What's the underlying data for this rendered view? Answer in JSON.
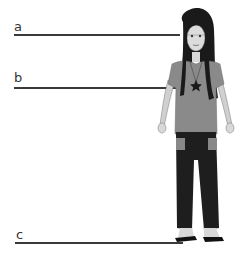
{
  "diagram": {
    "type": "labeled height reference lines with figure",
    "figure": "cartoon girl with long black hair, gray t-shirt, star necklace, black pants, flip-flops",
    "lines": [
      {
        "label": "a",
        "y": 34,
        "x1": 14,
        "x2": 180,
        "label_x": 14,
        "label_y": 20,
        "description": "head / eye level"
      },
      {
        "label": "b",
        "y": 87,
        "x1": 14,
        "x2": 186,
        "label_x": 14,
        "label_y": 72,
        "description": "chest level (star necklace)"
      },
      {
        "label": "c",
        "y": 242,
        "x1": 15,
        "x2": 180,
        "label_x": 16,
        "label_y": 228,
        "description": "ground level (feet)"
      }
    ],
    "colors": {
      "line": "#3a3a3a",
      "hair": "#1a1a1a",
      "skin": "#d8d8d8",
      "shirt": "#8a8a8a",
      "pants": "#1e1e1e",
      "background": "#ffffff"
    }
  }
}
